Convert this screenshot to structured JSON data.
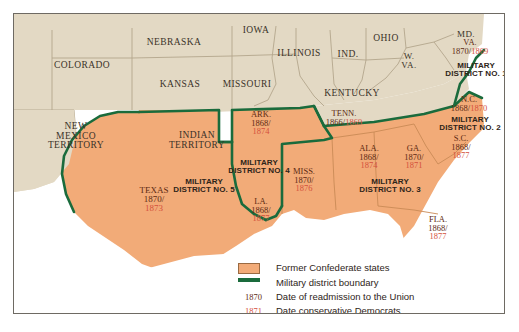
{
  "map": {
    "title": "Reconstruction Military Districts and Former Confederate States",
    "colors": {
      "confederate_fill": "#f2ab78",
      "union_fill": "#e3d9c4",
      "district_boundary": "#1a6b3c",
      "state_line": "#b3a68c",
      "water": "#ffffff",
      "readmission_date": "#5d2a12",
      "redeemer_date": "#d4503c"
    }
  },
  "union_states": [
    {
      "name": "COLORADO",
      "x": 68,
      "y": 52,
      "size": 9.5
    },
    {
      "name": "NEBRASKA",
      "x": 160,
      "y": 29,
      "size": 9.5
    },
    {
      "name": "IOWA",
      "x": 242,
      "y": 17,
      "size": 9.5
    },
    {
      "name": "KANSAS",
      "x": 166,
      "y": 71,
      "size": 9.5
    },
    {
      "name": "MISSOURI",
      "x": 233,
      "y": 71,
      "size": 9.5
    },
    {
      "name": "ILLINOIS",
      "x": 285,
      "y": 40,
      "size": 9.5
    },
    {
      "name": "IND.",
      "x": 334,
      "y": 41,
      "size": 9.5
    },
    {
      "name": "OHIO",
      "x": 372,
      "y": 25,
      "size": 9.5
    },
    {
      "name": "KENTUCKY",
      "x": 338,
      "y": 80,
      "size": 9.5
    },
    {
      "name": "MD.",
      "x": 452,
      "y": 21,
      "size": 9
    }
  ],
  "territories": [
    {
      "name": "NEW\nMEXICO\nTERRITORY",
      "x": 62,
      "y": 123,
      "size": 9.5
    },
    {
      "name": "INDIAN\nTERRITORY",
      "x": 183,
      "y": 127,
      "size": 9.5
    },
    {
      "name": "W.\nVA.",
      "x": 395,
      "y": 47,
      "size": 9
    }
  ],
  "confederate_states": [
    {
      "abbr": "VA.",
      "readmitted": "1870",
      "redeemed": "1869",
      "x": 456,
      "y": 33,
      "size": 8.5,
      "inline": true
    },
    {
      "abbr": "N.C.",
      "readmitted": "1868",
      "redeemed": "1870",
      "x": 455,
      "y": 90,
      "size": 8.5,
      "inline": true
    },
    {
      "abbr": "S.C.",
      "readmitted": "1868",
      "redeemed": "1877",
      "x": 447,
      "y": 133,
      "size": 8.5,
      "inline": false
    },
    {
      "abbr": "GA.",
      "readmitted": "1870",
      "redeemed": "1871",
      "x": 400,
      "y": 143,
      "size": 8.5,
      "inline": false
    },
    {
      "abbr": "FLA.",
      "readmitted": "1868",
      "redeemed": "1877",
      "x": 424,
      "y": 214,
      "size": 8.5,
      "inline": false
    },
    {
      "abbr": "ALA.",
      "readmitted": "1868",
      "redeemed": "1874",
      "x": 355,
      "y": 143,
      "size": 8.5,
      "inline": false
    },
    {
      "abbr": "MISS.",
      "readmitted": "1870",
      "redeemed": "1876",
      "x": 290,
      "y": 166,
      "size": 8.5,
      "inline": false
    },
    {
      "abbr": "TENN.",
      "readmitted": "1866",
      "redeemed": "1869",
      "x": 330,
      "y": 104,
      "size": 8.5,
      "inline": true
    },
    {
      "abbr": "ARK.",
      "readmitted": "1868",
      "redeemed": "1874",
      "x": 247,
      "y": 109,
      "size": 8.5,
      "inline": false
    },
    {
      "abbr": "LA.",
      "readmitted": "1868",
      "redeemed": "1877",
      "x": 247,
      "y": 196,
      "size": 8.5,
      "inline": false
    },
    {
      "abbr": "TEXAS",
      "readmitted": "1870",
      "redeemed": "1873",
      "x": 140,
      "y": 186,
      "size": 9,
      "inline": false
    }
  ],
  "military_districts": [
    {
      "label": "MILITARY\nDISTRICT NO. 1",
      "x": 462,
      "y": 56,
      "size": 8
    },
    {
      "label": "MILITARY\nDISTRICT NO. 2",
      "x": 456,
      "y": 110,
      "size": 8
    },
    {
      "label": "MILITARY\nDISTRICT NO. 3",
      "x": 376,
      "y": 172,
      "size": 8
    },
    {
      "label": "MILITARY\nDISTRICT NO. 4",
      "x": 245,
      "y": 153,
      "size": 8
    },
    {
      "label": "MILITARY\nDISTRICT NO. 5",
      "x": 190,
      "y": 172,
      "size": 8
    }
  ],
  "legend": {
    "rows": [
      {
        "kind": "swatch",
        "year": "",
        "text": "Former Confederate states"
      },
      {
        "kind": "line",
        "year": "",
        "text": "Military district boundary"
      },
      {
        "kind": "year",
        "year": "1870",
        "text": "Date of readmission to the Union",
        "year_color": "readmission"
      },
      {
        "kind": "year",
        "year": "1871",
        "text": "Date conservative Democrats\n(\"Redeemers\") regained power",
        "year_color": "redeemer"
      }
    ]
  }
}
